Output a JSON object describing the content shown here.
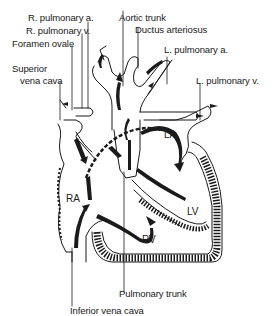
{
  "labels": {
    "r_pulmonary_a": "R. pulmonary a.",
    "r_pulmonary_v": "R. pulmonary v.",
    "foramen_ovale": "Foramen ovale",
    "superior_vena_cava_1": "Superior",
    "superior_vena_cava_2": "vena cava",
    "aortic_trunk": "Aortic trunk",
    "ductus_arteriosus": "Ductus arteriosus",
    "l_pulmonary_a": "L. pulmonary a.",
    "l_pulmonary_v": "L. pulmonary v.",
    "pulmonary_trunk": "Pulmonary trunk",
    "inferior_vena_cava": "Inferior vena cava"
  },
  "chambers": {
    "ra": "RA",
    "la": "LA",
    "lv": "LV",
    "rv": "RV"
  },
  "colors": {
    "ink": "#1a1a1a",
    "background": "#ffffff"
  }
}
